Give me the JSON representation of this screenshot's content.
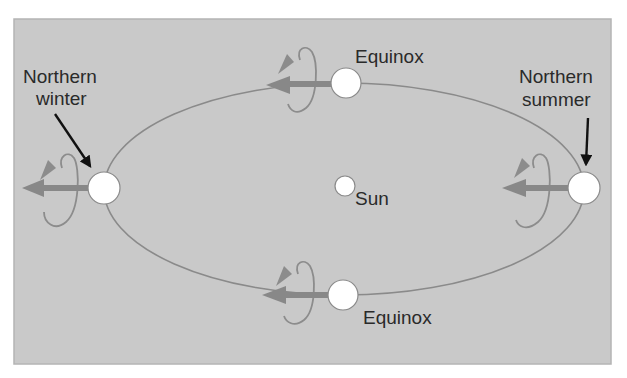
{
  "diagram": {
    "colors": {
      "page_background": "#ffffff",
      "panel_fill": "#c9c9c9",
      "panel_border": "#b4b4b4",
      "orbit_line": "#8a8a8a",
      "axis_arrow": "#888888",
      "rotation_loop": "#8c8c8c",
      "pointer_arrow": "#111111",
      "planet_fill": "#ffffff",
      "planet_stroke": "#8a8a8a",
      "text": "#2a2a2a"
    },
    "labels": {
      "northern_winter_line1": "Northern",
      "northern_winter_line2": "winter",
      "northern_summer_line1": "Northern",
      "northern_summer_line2": "summer",
      "equinox_top": "Equinox",
      "equinox_bottom": "Equinox",
      "sun": "Sun"
    },
    "bodies": [
      {
        "name": "sun",
        "label": "Sun"
      },
      {
        "name": "earth-northern-winter",
        "label": "Northern winter"
      },
      {
        "name": "earth-equinox-top",
        "label": "Equinox"
      },
      {
        "name": "earth-northern-summer",
        "label": "Northern summer"
      },
      {
        "name": "earth-equinox-bottom",
        "label": "Equinox"
      }
    ]
  }
}
